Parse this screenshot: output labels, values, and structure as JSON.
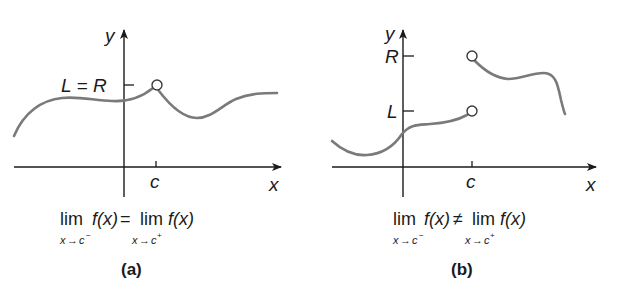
{
  "panels": [
    {
      "id": "a",
      "caption": "(a)",
      "axis_labels": {
        "x": "x",
        "y": "y"
      },
      "tick_label_x": "c",
      "tick_label_y": "L = R",
      "equation": {
        "lim_word": "lim",
        "lhs": "f(x)",
        "relation": "=",
        "rhs": "f(x)",
        "left_sub_var": "x",
        "left_sub_arrow": "→",
        "left_sub_target": "c",
        "left_sub_sign": "−",
        "right_sub_var": "x",
        "right_sub_arrow": "→",
        "right_sub_target": "c",
        "right_sub_sign": "+"
      },
      "open_circles": [
        {
          "at": "(c, L=R)"
        }
      ]
    },
    {
      "id": "b",
      "caption": "(b)",
      "axis_labels": {
        "x": "x",
        "y": "y"
      },
      "tick_label_x": "c",
      "tick_label_y_upper": "R",
      "tick_label_y_lower": "L",
      "equation": {
        "lim_word": "lim",
        "lhs": "f(x)",
        "relation": "≠",
        "rhs": "f(x)",
        "left_sub_var": "x",
        "left_sub_arrow": "→",
        "left_sub_target": "c",
        "left_sub_sign": "−",
        "right_sub_var": "x",
        "right_sub_arrow": "→",
        "right_sub_target": "c",
        "right_sub_sign": "+"
      },
      "open_circles": [
        {
          "at": "(c, L)"
        },
        {
          "at": "(c, R)"
        }
      ]
    }
  ],
  "colors": {
    "curve": "#7a7a7a",
    "axis": "#1a1a1a",
    "background": "#ffffff"
  }
}
